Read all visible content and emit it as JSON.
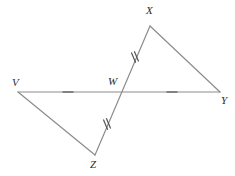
{
  "figure": {
    "kind": "geometry-diagram",
    "width": 235,
    "height": 176,
    "background_color": "#ffffff",
    "line_color": "#8c8c8c",
    "tick_color": "#555555",
    "label_color": "#2b2b2b",
    "line_width": 1.2,
    "tick_width": 1.2
  },
  "points": {
    "V": {
      "label": "V",
      "x": 18,
      "y": 92,
      "label_x": 12,
      "label_y": 77
    },
    "W": {
      "label": "W",
      "x": 120,
      "y": 92,
      "label_x": 108,
      "label_y": 76
    },
    "X": {
      "label": "X",
      "x": 150,
      "y": 26,
      "label_x": 146,
      "label_y": 5
    },
    "Y": {
      "label": "Y",
      "x": 220,
      "y": 92,
      "label_x": 221,
      "label_y": 95
    },
    "Z": {
      "label": "Z",
      "x": 95,
      "y": 155,
      "label_x": 90,
      "label_y": 159
    }
  },
  "segments": [
    {
      "name": "segment-VY",
      "from": "V",
      "to": "Y",
      "x1": 18,
      "y1": 92,
      "x2": 220,
      "y2": 92
    },
    {
      "name": "segment-XZ",
      "from": "X",
      "to": "Z",
      "x1": 150,
      "y1": 26,
      "x2": 95,
      "y2": 155
    },
    {
      "name": "segment-VZ",
      "from": "V",
      "to": "Z",
      "x1": 18,
      "y1": 92,
      "x2": 95,
      "y2": 155
    },
    {
      "name": "segment-XY",
      "from": "X",
      "to": "Y",
      "x1": 150,
      "y1": 26,
      "x2": 220,
      "y2": 92
    }
  ],
  "tick_marks": [
    {
      "name": "tick-segment-VW",
      "segment": "VW",
      "count": 1,
      "cx": 68,
      "cy": 92,
      "angle_deg": 0,
      "length": 11
    },
    {
      "name": "tick-segment-WY",
      "segment": "WY",
      "count": 1,
      "cx": 172,
      "cy": 92,
      "angle_deg": 0,
      "length": 11
    },
    {
      "name": "tick-segment-WX",
      "segment": "WX",
      "count": 2,
      "cx": 135,
      "cy": 57,
      "angle_deg": 67,
      "length": 11
    },
    {
      "name": "tick-segment-WZ",
      "segment": "WZ",
      "count": 2,
      "cx": 107,
      "cy": 124,
      "angle_deg": 67,
      "length": 11
    }
  ]
}
